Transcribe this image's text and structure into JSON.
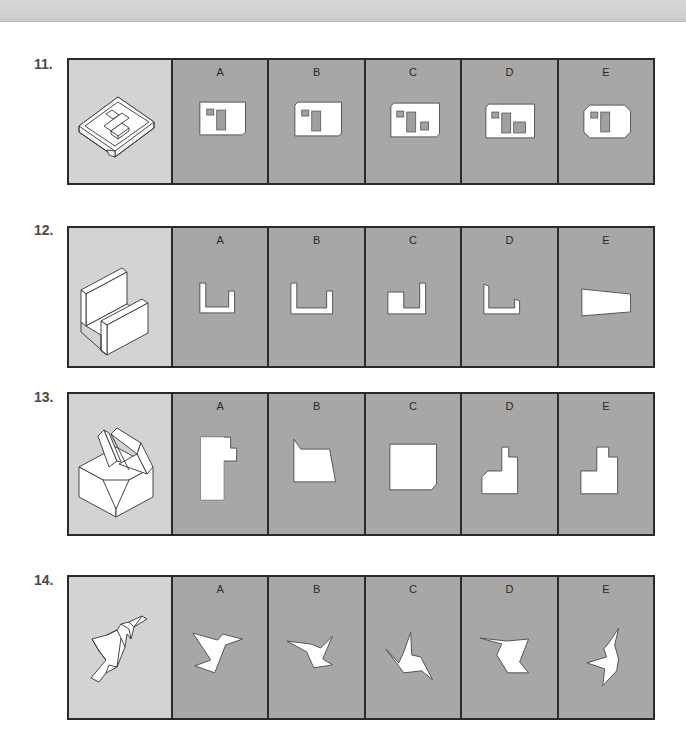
{
  "page": {
    "type": "spatial-reasoning test sheet (orthographic view selection)"
  },
  "questions": [
    {
      "number": "11.",
      "stem_figure": "isometric-tray-with-raised-blocks",
      "options": [
        {
          "label": "A",
          "figure": "square-plate-chamfer-bottom-right-two-rects"
        },
        {
          "label": "B",
          "figure": "square-plate-chamfer-top-left-bottom-right-two-rects"
        },
        {
          "label": "C",
          "figure": "plate-chamfer-top-left-bottom-right-three-rects"
        },
        {
          "label": "D",
          "figure": "wide-plate-chamfer-top-left-three-rects"
        },
        {
          "label": "E",
          "figure": "octagon-plate-two-rects"
        }
      ]
    },
    {
      "number": "12.",
      "stem_figure": "isometric-u-channel",
      "options": [
        {
          "label": "A",
          "figure": "u-shape-tall-left-short-right"
        },
        {
          "label": "B",
          "figure": "u-shape-tall-left-short-right-wide"
        },
        {
          "label": "C",
          "figure": "u-shape-short-left-tall-right"
        },
        {
          "label": "D",
          "figure": "u-shape-slanted-tops"
        },
        {
          "label": "E",
          "figure": "trapezoid"
        }
      ]
    },
    {
      "number": "13.",
      "stem_figure": "isometric-block-with-slanted-fins",
      "options": [
        {
          "label": "A",
          "figure": "stepped-l-shape-vertical"
        },
        {
          "label": "B",
          "figure": "slanted-quadrilateral-with-notch"
        },
        {
          "label": "C",
          "figure": "square-with-chamfer-bottom-right"
        },
        {
          "label": "D",
          "figure": "stepped-shape-chamfer-left"
        },
        {
          "label": "E",
          "figure": "stepped-shape"
        }
      ]
    },
    {
      "number": "14.",
      "stem_figure": "isometric-bird-shaped-fold",
      "options": [
        {
          "label": "A",
          "figure": "bird-silhouette-a"
        },
        {
          "label": "B",
          "figure": "bird-silhouette-b"
        },
        {
          "label": "C",
          "figure": "bird-silhouette-c"
        },
        {
          "label": "D",
          "figure": "bird-silhouette-d"
        },
        {
          "label": "E",
          "figure": "bird-silhouette-e"
        }
      ]
    }
  ],
  "colors": {
    "stem_bg": "#d3d3d3",
    "option_bg": "#a7a7a7",
    "border": "#2a2a2a",
    "shape_fill": "#ffffff",
    "inner_rect": "#a0a0a0",
    "number_text": "#4a4a4a"
  }
}
